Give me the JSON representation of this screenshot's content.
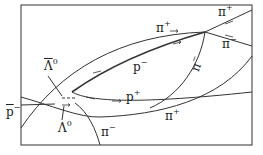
{
  "diagram": {
    "type": "bubble-chamber-track-sketch",
    "frame": {
      "x": 21,
      "y": 5,
      "w": 231,
      "h": 140
    },
    "colors": {
      "ink": "#333333",
      "background": "#ffffff"
    },
    "labels": {
      "p_bar_incoming": {
        "base": "p",
        "sup": "−",
        "overbar": true
      },
      "anti_lambda0": {
        "base": "Λ",
        "sup": "0",
        "overbar": true
      },
      "lambda0": {
        "base": "Λ",
        "sup": "0"
      },
      "p_minus": {
        "base": "p",
        "sup": "−"
      },
      "p_plus": {
        "base": "p",
        "sup": "+"
      },
      "pi_plus_top": {
        "base": "π",
        "sup": "+"
      },
      "pi_plus_topright": {
        "base": "π",
        "sup": "+"
      },
      "pi_minus_right": {
        "base": "π",
        "sup": "−"
      },
      "pi_minus_diag": {
        "base": "π",
        "sup": "−"
      },
      "pi_plus_bottom": {
        "base": "π",
        "sup": "+"
      },
      "pi_minus_bottom": {
        "base": "π",
        "sup": "−"
      }
    }
  }
}
